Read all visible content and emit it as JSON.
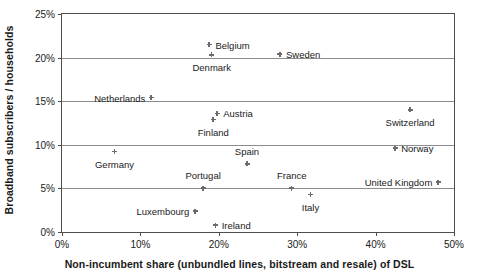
{
  "chart_data": {
    "type": "scatter",
    "title": "",
    "xlabel": "Non-incumbent share (unbundled lines, bitstream and resale) of DSL",
    "ylabel": "Broadband subscribers / households",
    "xlim": [
      0,
      50
    ],
    "ylim": [
      0,
      25
    ],
    "xticks": [
      "0%",
      "10%",
      "20%",
      "30%",
      "40%",
      "50%"
    ],
    "xtick_values": [
      0,
      10,
      20,
      30,
      40,
      50
    ],
    "yticks": [
      "0%",
      "5%",
      "10%",
      "15%",
      "20%",
      "25%"
    ],
    "ytick_values": [
      0,
      5,
      10,
      15,
      20,
      25
    ],
    "grid": "horizontal",
    "legend": "none",
    "points": [
      {
        "label": "Belgium",
        "x": 18.8,
        "y": 21.5,
        "label_pos": "right"
      },
      {
        "label": "Denmark",
        "x": 19.1,
        "y": 20.3,
        "label_pos": "below"
      },
      {
        "label": "Sweden",
        "x": 27.8,
        "y": 20.4,
        "label_pos": "right"
      },
      {
        "label": "Netherlands",
        "x": 11.4,
        "y": 15.4,
        "label_pos": "left"
      },
      {
        "label": "Switzerland",
        "x": 44.4,
        "y": 14.0,
        "label_pos": "below"
      },
      {
        "label": "Austria",
        "x": 19.8,
        "y": 13.6,
        "label_pos": "right"
      },
      {
        "label": "Finland",
        "x": 19.3,
        "y": 12.9,
        "label_pos": "below"
      },
      {
        "label": "Norway",
        "x": 42.5,
        "y": 9.6,
        "label_pos": "right"
      },
      {
        "label": "Germany",
        "x": 6.7,
        "y": 9.2,
        "label_pos": "below"
      },
      {
        "label": "Spain",
        "x": 23.6,
        "y": 7.8,
        "label_pos": "above"
      },
      {
        "label": "United Kingdom",
        "x": 48.0,
        "y": 5.7,
        "label_pos": "left"
      },
      {
        "label": "Portugal",
        "x": 18.0,
        "y": 5.0,
        "label_pos": "above"
      },
      {
        "label": "France",
        "x": 29.3,
        "y": 5.0,
        "label_pos": "above"
      },
      {
        "label": "Italy",
        "x": 31.7,
        "y": 4.3,
        "label_pos": "below"
      },
      {
        "label": "Luxembourg",
        "x": 17.0,
        "y": 2.4,
        "label_pos": "left"
      },
      {
        "label": "Ireland",
        "x": 19.6,
        "y": 0.8,
        "label_pos": "right"
      }
    ]
  },
  "colors": {
    "marker": "#6b6b6b",
    "frame": "#4d4d4d",
    "gridline": "#8c8c8c",
    "text": "#1a1a1a",
    "background": "#ffffff"
  }
}
